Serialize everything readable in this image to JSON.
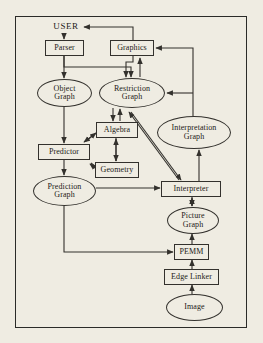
{
  "diagram": {
    "type": "flowchart",
    "colors": {
      "background": "#efece2",
      "stroke": "#33312d",
      "text": "#1c1a17"
    },
    "nodes": [
      {
        "id": "user",
        "label": "USER",
        "shape": "plain",
        "x": 50,
        "y": 21,
        "w": 32,
        "h": 12
      },
      {
        "id": "parser",
        "label": "Parser",
        "shape": "box",
        "x": 45,
        "y": 40,
        "w": 39,
        "h": 16
      },
      {
        "id": "graphics",
        "label": "Graphics",
        "shape": "box",
        "x": 110,
        "y": 40,
        "w": 44,
        "h": 16
      },
      {
        "id": "object-graph",
        "line1": "Object",
        "line2": "Graph",
        "shape": "ellipse",
        "x": 37,
        "y": 79,
        "w": 55,
        "h": 28
      },
      {
        "id": "restriction-graph",
        "line1": "Restriction",
        "line2": "Graph",
        "shape": "ellipse",
        "x": 99,
        "y": 78,
        "w": 66,
        "h": 30
      },
      {
        "id": "algebra",
        "label": "Algebra",
        "shape": "box",
        "x": 96,
        "y": 122,
        "w": 42,
        "h": 16
      },
      {
        "id": "predictor",
        "label": "Predictor",
        "shape": "box",
        "x": 38,
        "y": 144,
        "w": 52,
        "h": 16
      },
      {
        "id": "geometry",
        "label": "Geometry",
        "shape": "box",
        "x": 95,
        "y": 162,
        "w": 44,
        "h": 16
      },
      {
        "id": "interpretation-graph",
        "line1": "Interpretation",
        "line2": "Graph",
        "shape": "ellipse",
        "x": 157,
        "y": 116,
        "w": 74,
        "h": 33
      },
      {
        "id": "prediction-graph",
        "line1": "Prediction",
        "line2": "Graph",
        "shape": "ellipse",
        "x": 33,
        "y": 176,
        "w": 63,
        "h": 30
      },
      {
        "id": "interpreter",
        "label": "Interpreter",
        "shape": "box",
        "x": 161,
        "y": 181,
        "w": 60,
        "h": 16
      },
      {
        "id": "picture-graph",
        "line1": "Picture",
        "line2": "Graph",
        "shape": "ellipse",
        "x": 167,
        "y": 207,
        "w": 52,
        "h": 27
      },
      {
        "id": "pemm",
        "label": "PEMM",
        "shape": "box",
        "x": 174,
        "y": 244,
        "w": 35,
        "h": 16
      },
      {
        "id": "edge-linker",
        "label": "Edge Linker",
        "shape": "box",
        "x": 164,
        "y": 269,
        "w": 55,
        "h": 16
      },
      {
        "id": "image",
        "label": "Image",
        "shape": "ellipse",
        "x": 166,
        "y": 294,
        "w": 57,
        "h": 27
      }
    ],
    "edges": [
      {
        "from": "user",
        "to": "parser"
      },
      {
        "from": "graphics",
        "to": "user"
      },
      {
        "from": "parser",
        "to": "object-graph"
      },
      {
        "from": "parser",
        "to": "restriction-graph"
      },
      {
        "from": "graphics",
        "to": "restriction-graph"
      },
      {
        "from": "restriction-graph",
        "to": "graphics"
      },
      {
        "from": "object-graph",
        "to": "predictor"
      },
      {
        "from": "restriction-graph",
        "to": "algebra"
      },
      {
        "from": "algebra",
        "to": "restriction-graph"
      },
      {
        "from": "algebra",
        "to": "predictor"
      },
      {
        "from": "predictor",
        "to": "algebra"
      },
      {
        "from": "algebra",
        "to": "geometry"
      },
      {
        "from": "geometry",
        "to": "algebra"
      },
      {
        "from": "predictor",
        "to": "geometry"
      },
      {
        "from": "geometry",
        "to": "predictor"
      },
      {
        "from": "predictor",
        "to": "prediction-graph"
      },
      {
        "from": "interpretation-graph",
        "to": "graphics"
      },
      {
        "from": "interpretation-graph",
        "to": "restriction-graph"
      },
      {
        "from": "restriction-graph",
        "to": "interpreter"
      },
      {
        "from": "interpreter",
        "to": "restriction-graph"
      },
      {
        "from": "prediction-graph",
        "to": "interpreter"
      },
      {
        "from": "prediction-graph",
        "to": "pemm"
      },
      {
        "from": "interpreter",
        "to": "picture-graph"
      },
      {
        "from": "picture-graph",
        "to": "interpreter"
      },
      {
        "from": "pemm",
        "to": "picture-graph"
      },
      {
        "from": "edge-linker",
        "to": "pemm"
      },
      {
        "from": "image",
        "to": "edge-linker"
      },
      {
        "from": "interpreter",
        "to": "interpretation-graph"
      }
    ]
  }
}
